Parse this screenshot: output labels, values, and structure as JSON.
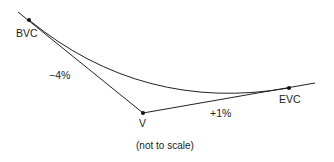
{
  "diagram": {
    "type": "sag vertical curve",
    "labels": {
      "bvc": "BVC",
      "v": "V",
      "evc": "EVC",
      "grade_in": "−4%",
      "grade_out": "+1%",
      "note": "(not to scale)"
    },
    "colors": {
      "line": "#222222",
      "background": "#ffffff"
    }
  }
}
